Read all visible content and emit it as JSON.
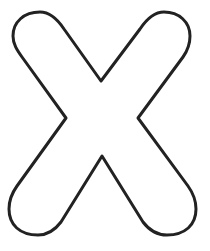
{
  "figure": {
    "letter": "X",
    "style": "outline",
    "stroke_color": "#222222",
    "fill_color": "#ffffff",
    "background_color": "#ffffff",
    "stroke_width": 3
  }
}
